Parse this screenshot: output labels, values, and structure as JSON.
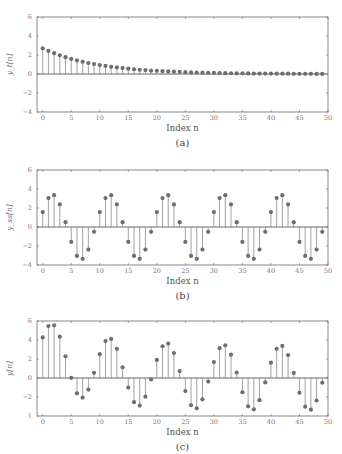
{
  "chart_data": [
    {
      "id": "a",
      "type": "stem",
      "caption": "(a)",
      "xlabel": "Index n",
      "ylabel": "y_t[n]",
      "xlim": [
        -1,
        50
      ],
      "ylim": [
        -4,
        6
      ],
      "xticks": [
        "0",
        "5",
        "10",
        "15",
        "20",
        "25",
        "30",
        "35",
        "40",
        "45",
        "50"
      ],
      "yticks": [
        "-4",
        "-2",
        "0",
        "2",
        "4",
        "6"
      ],
      "grid": false,
      "x": [
        0,
        1,
        2,
        3,
        4,
        5,
        6,
        7,
        8,
        9,
        10,
        11,
        12,
        13,
        14,
        15,
        16,
        17,
        18,
        19,
        20,
        21,
        22,
        23,
        24,
        25,
        26,
        27,
        28,
        29,
        30,
        31,
        32,
        33,
        34,
        35,
        36,
        37,
        38,
        39,
        40,
        41,
        42,
        43,
        44,
        45,
        46,
        47,
        48,
        49
      ],
      "values": [
        2.7,
        2.43,
        2.19,
        1.97,
        1.77,
        1.59,
        1.43,
        1.29,
        1.16,
        1.05,
        0.94,
        0.85,
        0.76,
        0.69,
        0.62,
        0.56,
        0.5,
        0.45,
        0.41,
        0.36,
        0.33,
        0.3,
        0.27,
        0.24,
        0.22,
        0.19,
        0.17,
        0.16,
        0.14,
        0.13,
        0.11,
        0.1,
        0.09,
        0.08,
        0.07,
        0.07,
        0.06,
        0.05,
        0.05,
        0.04,
        0.04,
        0.03,
        0.03,
        0.03,
        0.02,
        0.02,
        0.02,
        0.02,
        0.01,
        0.01
      ]
    },
    {
      "id": "b",
      "type": "stem",
      "caption": "(b)",
      "xlabel": "Index n",
      "ylabel": "y_ss[n]",
      "xlim": [
        -1,
        50
      ],
      "ylim": [
        -4,
        6
      ],
      "xticks": [
        "0",
        "5",
        "10",
        "15",
        "20",
        "25",
        "30",
        "35",
        "40",
        "45",
        "50"
      ],
      "yticks": [
        "-4",
        "-2",
        "0",
        "2",
        "4",
        "6"
      ],
      "grid": false,
      "x": [
        0,
        1,
        2,
        3,
        4,
        5,
        6,
        7,
        8,
        9,
        10,
        11,
        12,
        13,
        14,
        15,
        16,
        17,
        18,
        19,
        20,
        21,
        22,
        23,
        24,
        25,
        26,
        27,
        28,
        29,
        30,
        31,
        32,
        33,
        34,
        35,
        36,
        37,
        38,
        39,
        40,
        41,
        42,
        43,
        44,
        45,
        46,
        47,
        48,
        49
      ],
      "values": [
        1.57,
        3.04,
        3.35,
        2.38,
        0.51,
        -1.57,
        -3.04,
        -3.35,
        -2.38,
        -0.51,
        1.57,
        3.04,
        3.35,
        2.38,
        0.51,
        -1.57,
        -3.04,
        -3.35,
        -2.38,
        -0.51,
        1.57,
        3.04,
        3.35,
        2.38,
        0.51,
        -1.57,
        -3.04,
        -3.35,
        -2.38,
        -0.51,
        1.57,
        3.04,
        3.35,
        2.38,
        0.51,
        -1.57,
        -3.04,
        -3.35,
        -2.38,
        -0.51,
        1.57,
        3.04,
        3.35,
        2.38,
        0.51,
        -1.57,
        -3.04,
        -3.35,
        -2.38,
        -0.51
      ]
    },
    {
      "id": "c",
      "type": "stem",
      "caption": "(c)",
      "xlabel": "Index n",
      "ylabel": "y[n]",
      "xlim": [
        -1,
        50
      ],
      "ylim": [
        -4,
        6
      ],
      "xticks": [
        "0",
        "5",
        "10",
        "15",
        "20",
        "25",
        "30",
        "35",
        "40",
        "45",
        "50"
      ],
      "yticks": [
        "1",
        "-2",
        "0",
        "2",
        "4",
        "6"
      ],
      "grid": false,
      "x": [
        0,
        1,
        2,
        3,
        4,
        5,
        6,
        7,
        8,
        9,
        10,
        11,
        12,
        13,
        14,
        15,
        16,
        17,
        18,
        19,
        20,
        21,
        22,
        23,
        24,
        25,
        26,
        27,
        28,
        29,
        30,
        31,
        32,
        33,
        34,
        35,
        36,
        37,
        38,
        39,
        40,
        41,
        42,
        43,
        44,
        45,
        46,
        47,
        48,
        49
      ],
      "values": [
        4.27,
        5.47,
        5.54,
        4.35,
        2.28,
        0.02,
        -1.61,
        -2.06,
        -1.22,
        0.54,
        2.51,
        3.89,
        4.11,
        3.07,
        1.13,
        -1.01,
        -2.54,
        -2.9,
        -1.97,
        -0.15,
        1.9,
        3.34,
        3.62,
        2.62,
        0.73,
        -1.38,
        -2.87,
        -3.19,
        -2.24,
        -0.38,
        1.68,
        3.14,
        3.44,
        2.46,
        0.58,
        -1.5,
        -2.98,
        -3.3,
        -2.33,
        -0.47,
        1.61,
        3.07,
        3.38,
        2.41,
        0.53,
        -1.55,
        -3.02,
        -3.33,
        -2.37,
        -0.5
      ]
    }
  ],
  "style": {
    "stem_color": "#8a8a8a",
    "marker_color": "#6e6e6e",
    "axis_color": "#6a6a6a"
  }
}
